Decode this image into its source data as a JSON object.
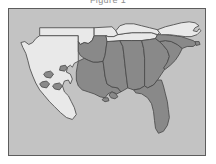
{
  "figure": {
    "title": "Figure 1",
    "background_color": "#ffffff",
    "frame_border_color": "#5d5d5d",
    "water_background_color": "#c3c3c3",
    "type": "choropleth-map",
    "region": "Southern United States"
  },
  "legend": {
    "shaded_color": "#898989",
    "unshaded_color": "#e9e9e9",
    "outline_color": "#4a4a4a",
    "shaded_label": "Shaded",
    "unshaded_label": "Unshaded"
  },
  "map_data": {
    "type": "choropleth",
    "title": "Figure 1",
    "categories": [
      "Shaded",
      "Unshaded"
    ],
    "states": [
      {
        "name": "Texas",
        "abbr": "TX",
        "shaded": false
      },
      {
        "name": "Oklahoma",
        "abbr": "OK",
        "shaded": false
      },
      {
        "name": "Louisiana",
        "abbr": "LA",
        "shaded": true
      },
      {
        "name": "Arkansas",
        "abbr": "AR",
        "shaded": true
      },
      {
        "name": "Missouri",
        "abbr": "MO",
        "shaded": false
      },
      {
        "name": "Mississippi",
        "abbr": "MS",
        "shaded": true
      },
      {
        "name": "Alabama",
        "abbr": "AL",
        "shaded": true
      },
      {
        "name": "Tennessee",
        "abbr": "TN",
        "shaded": false
      },
      {
        "name": "Kentucky",
        "abbr": "KY",
        "shaded": false
      },
      {
        "name": "Georgia",
        "abbr": "GA",
        "shaded": true
      },
      {
        "name": "Florida",
        "abbr": "FL",
        "shaded": true
      },
      {
        "name": "South Carolina",
        "abbr": "SC",
        "shaded": true
      },
      {
        "name": "North Carolina",
        "abbr": "NC",
        "shaded": true
      },
      {
        "name": "Virginia",
        "abbr": "VA",
        "shaded": false
      }
    ],
    "shaded_count": 8,
    "unshaded_count": 6
  }
}
